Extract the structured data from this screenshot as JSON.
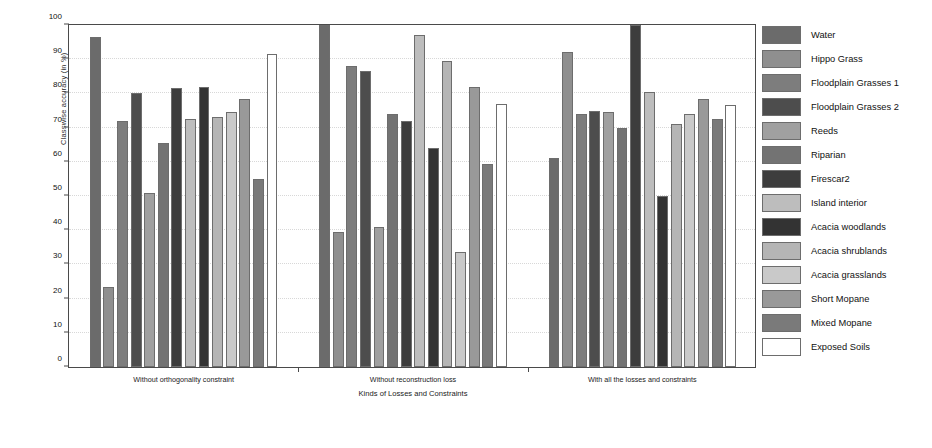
{
  "chart_data": {
    "type": "bar",
    "title": "",
    "xlabel": "Kinds of Losses and Constraints",
    "ylabel": "Classwise accuracy (in %)",
    "ylim": [
      0,
      100
    ],
    "yticks": [
      0,
      10,
      20,
      30,
      40,
      50,
      60,
      70,
      80,
      90,
      100
    ],
    "grid": true,
    "legend_position": "right",
    "categories": [
      "Without orthogonality constraint",
      "Without reconstruction loss",
      "With all the losses and constraints"
    ],
    "series": [
      {
        "name": "Water",
        "color": "#6b6b6b",
        "values": [
          96.5,
          100.0,
          61.0
        ]
      },
      {
        "name": "Hippo Grass",
        "color": "#8f8f8f",
        "values": [
          23.5,
          39.5,
          92.0
        ]
      },
      {
        "name": "Floodplain Grasses 1",
        "color": "#7d7d7d",
        "values": [
          72.0,
          88.0,
          74.0
        ]
      },
      {
        "name": "Floodplain Grasses 2",
        "color": "#4d4d4d",
        "values": [
          80.0,
          86.5,
          75.0
        ]
      },
      {
        "name": "Reeds",
        "color": "#a0a0a0",
        "values": [
          51.0,
          41.0,
          74.5
        ]
      },
      {
        "name": "Riparian",
        "color": "#737373",
        "values": [
          65.5,
          74.0,
          70.0
        ]
      },
      {
        "name": "Firescar2",
        "color": "#3d3d3d",
        "values": [
          81.5,
          72.0,
          100.0
        ]
      },
      {
        "name": "Island interior",
        "color": "#bdbdbd",
        "values": [
          72.5,
          97.0,
          80.5
        ]
      },
      {
        "name": "Acacia woodlands",
        "color": "#333333",
        "values": [
          82.0,
          64.0,
          50.0
        ]
      },
      {
        "name": "Acacia shrublands",
        "color": "#b5b5b5",
        "values": [
          73.0,
          89.5,
          71.0
        ]
      },
      {
        "name": "Acacia grasslands",
        "color": "#c9c9c9",
        "values": [
          74.5,
          33.5,
          74.0
        ]
      },
      {
        "name": "Short Mopane",
        "color": "#999999",
        "values": [
          78.5,
          82.0,
          78.5
        ]
      },
      {
        "name": "Mixed Mopane",
        "color": "#7a7a7a",
        "values": [
          55.0,
          59.5,
          72.5
        ]
      },
      {
        "name": "Exposed Soils",
        "color": "#ffffff",
        "values": [
          91.5,
          77.0,
          76.5
        ]
      }
    ]
  }
}
